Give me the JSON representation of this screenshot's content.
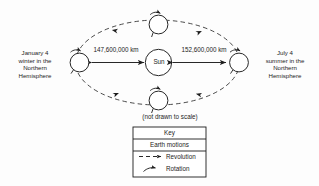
{
  "diagram": {
    "caption": "(not drawn to scale)",
    "center_body": "Sun",
    "positions": {
      "left": {
        "date": "January 4",
        "line2": "winter in the",
        "line3": "Northern",
        "line4": "Hemisphere",
        "distance_label": "147,600,000 km"
      },
      "right": {
        "date": "July 4",
        "line2": "summer in the",
        "line3": "Northern",
        "line4": "Hemisphere",
        "distance_label": "152,600,000 km"
      }
    },
    "key": {
      "title": "Key",
      "subtitle": "Earth motions",
      "entries": [
        {
          "icon": "dashed-arrow-icon",
          "label": "Revolution"
        },
        {
          "icon": "curved-arrow-icon",
          "label": "Rotation"
        }
      ]
    },
    "colors": {
      "ink": "#1c1c1c",
      "background": "#fdfdfd",
      "orbit": "#2a2a2a"
    }
  }
}
